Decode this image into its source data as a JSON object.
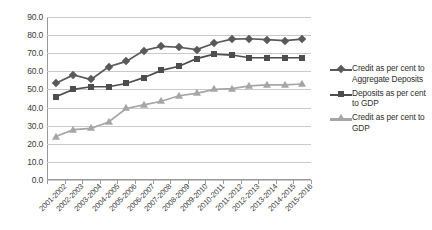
{
  "chart_data": {
    "type": "line",
    "title": "",
    "subtitle": "",
    "xlabel": "",
    "ylabel": "",
    "ylim": [
      0.0,
      90.0
    ],
    "ytick_labels": [
      "90.0",
      "80.0",
      "70.0",
      "60.0",
      "50.0",
      "40.0",
      "30.0",
      "20.0",
      "10.0",
      "0.0"
    ],
    "ytick_values": [
      90.0,
      80.0,
      70.0,
      60.0,
      50.0,
      40.0,
      30.0,
      20.0,
      10.0,
      0.0
    ],
    "grid": true,
    "legend_position": "right",
    "categories": [
      "2001-2002",
      "2002-2003",
      "2003-2004",
      "2004-2005",
      "2005-2006",
      "2006-2007",
      "2007-2008",
      "2008-2009",
      "2009-2010",
      "2010-2011",
      "2011-2012",
      "2012-2013",
      "2013-2014",
      "2014-2015",
      "2015-2016"
    ],
    "series": [
      {
        "name": "Credit as per cent to Aggregate Deposits",
        "marker": "diamond",
        "color": "#595959",
        "values": [
          53.4,
          58.0,
          55.5,
          62.5,
          65.5,
          71.5,
          73.8,
          73.3,
          72.0,
          75.5,
          77.8,
          78.0,
          77.5,
          77.0,
          77.8
        ]
      },
      {
        "name": "Deposits as per cent to GDP",
        "marker": "square",
        "color": "#4d4d4d",
        "values": [
          46.0,
          50.0,
          51.5,
          51.5,
          53.3,
          56.5,
          60.5,
          62.8,
          67.0,
          69.5,
          69.0,
          67.5,
          67.5,
          67.5,
          67.5
        ]
      },
      {
        "name": "Credit as per cent to GDP",
        "marker": "triangle",
        "color": "#a6a6a6",
        "values": [
          24.0,
          27.8,
          28.5,
          32.0,
          39.5,
          41.5,
          43.5,
          46.5,
          47.8,
          50.0,
          50.5,
          52.0,
          52.5,
          52.5,
          53.0
        ]
      }
    ]
  },
  "legend": {
    "entries": [
      {
        "label": "Credit as per cent to Aggregate Deposits",
        "marker": "diamond-marker",
        "color": "#595959"
      },
      {
        "label": "Deposits as per cent to GDP",
        "marker": "square-marker",
        "color": "#4d4d4d"
      },
      {
        "label": "Credit as per cent to GDP",
        "marker": "triangle-marker",
        "color": "#a6a6a6"
      }
    ]
  }
}
